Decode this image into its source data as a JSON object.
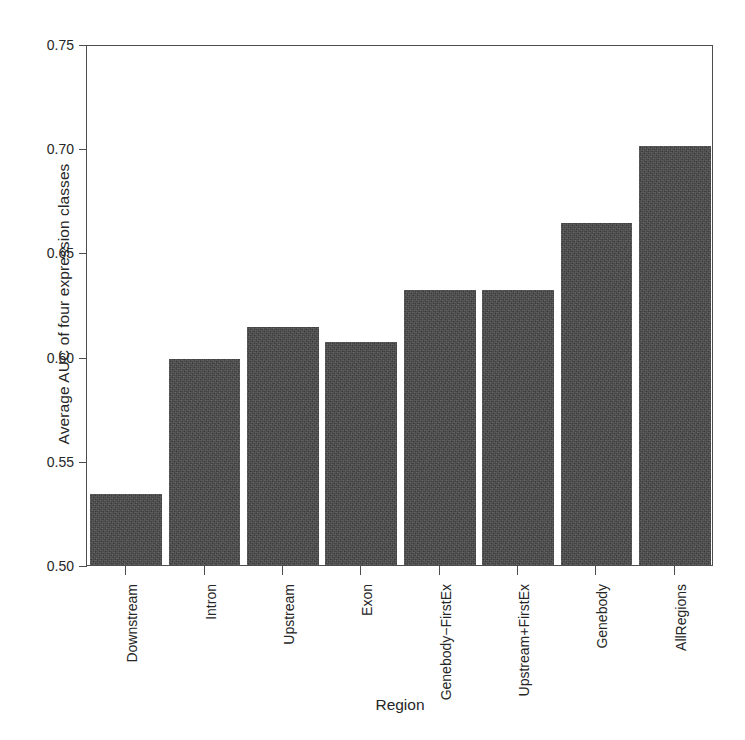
{
  "chart_data": {
    "type": "bar",
    "title": "",
    "xlabel": "Region",
    "ylabel": "Average AUC of four expression classes",
    "categories": [
      "Downstream",
      "Intron",
      "Upstream",
      "Exon",
      "Genebody−FirstEx",
      "Upstream+FirstEx",
      "Genebody",
      "AllRegions"
    ],
    "values": [
      0.534,
      0.599,
      0.614,
      0.607,
      0.632,
      0.632,
      0.664,
      0.701
    ],
    "ylim": [
      0.5,
      0.75
    ],
    "yticks": [
      0.5,
      0.55,
      0.6,
      0.65,
      0.7,
      0.75
    ],
    "ytick_labels": [
      "0.50",
      "0.55",
      "0.60",
      "0.65",
      "0.70",
      "0.75"
    ],
    "grid": false,
    "legend": null,
    "bar_color": "#4a4a4a",
    "axis_color": "#4d4d4d",
    "background": "#ffffff"
  }
}
